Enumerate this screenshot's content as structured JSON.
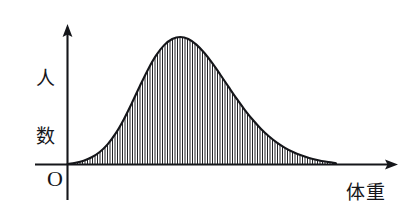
{
  "figure": {
    "background_color": "#ffffff",
    "ink_color": "#15161a"
  },
  "labels": {
    "y_axis": "人数",
    "y_axis_char_1": "人",
    "y_axis_char_2": "数",
    "x_axis": "体重",
    "origin": "O"
  },
  "chart_data": {
    "type": "area",
    "title": "",
    "subtitle": "",
    "xlabel": "体重",
    "ylabel": "人数",
    "legend": [],
    "grid": false,
    "axis_ticks": {
      "x": [],
      "y": []
    },
    "axis_arrows": {
      "x": "right",
      "y": "up"
    },
    "xlim": [
      0,
      1
    ],
    "ylim": [
      0,
      1
    ],
    "fill_style": "vertical-hatch",
    "hatch_spacing_px": 2.5,
    "annotations": [
      {
        "text": "O",
        "x": 0,
        "y": 0,
        "position": "below-left-of-origin"
      },
      {
        "text": "人数",
        "x": 0,
        "y": 1,
        "position": "left-of-y-axis"
      },
      {
        "text": "体重",
        "x": 1,
        "y": 0,
        "position": "below-x-axis-right"
      }
    ],
    "series": [
      {
        "name": "人数分布",
        "kind": "bell-curve",
        "peak_x": 0.37,
        "peak_y": 1.0,
        "x": [
          0.0,
          0.03,
          0.06,
          0.09,
          0.12,
          0.15,
          0.18,
          0.21,
          0.24,
          0.27,
          0.3,
          0.33,
          0.36,
          0.39,
          0.42,
          0.45,
          0.48,
          0.51,
          0.54,
          0.57,
          0.6,
          0.63,
          0.66,
          0.69,
          0.72,
          0.75,
          0.78,
          0.81,
          0.84,
          0.87,
          0.9,
          0.93,
          0.96,
          1.0
        ],
        "values": [
          0.0,
          0.01,
          0.026,
          0.053,
          0.095,
          0.157,
          0.243,
          0.353,
          0.481,
          0.616,
          0.745,
          0.855,
          0.936,
          0.984,
          1.0,
          0.984,
          0.94,
          0.874,
          0.792,
          0.701,
          0.607,
          0.514,
          0.427,
          0.348,
          0.278,
          0.218,
          0.168,
          0.127,
          0.094,
          0.068,
          0.048,
          0.032,
          0.019,
          0.006
        ]
      }
    ]
  }
}
